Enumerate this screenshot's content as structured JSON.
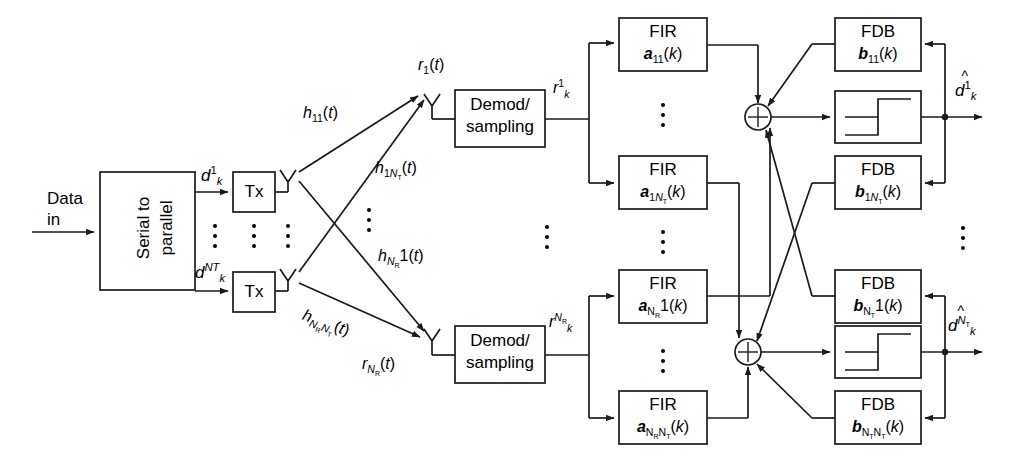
{
  "diagram": {
    "type": "block-diagram",
    "stroke_color": "#1a1a1a",
    "background": "#ffffff"
  },
  "input": {
    "label_line1": "Data",
    "label_line2": "in"
  },
  "serial_to_parallel": {
    "line1": "Serial to",
    "line2": "parallel"
  },
  "tx": {
    "top_label": "Tx",
    "bottom_label": "Tx"
  },
  "tx_signals": {
    "top": {
      "base": "d",
      "sub": "k",
      "sup": "1"
    },
    "bottom": {
      "base": "d",
      "sub": "k",
      "sup": "NT"
    }
  },
  "channels": [
    {
      "name": "h-11",
      "base": "h",
      "sub": "11",
      "arg": "(t)"
    },
    {
      "name": "h-1NT",
      "base": "h",
      "sub": "1N_T",
      "arg": "(t)"
    },
    {
      "name": "h-NR1",
      "base": "h",
      "sub": "N_R 1",
      "arg": "(t)"
    },
    {
      "name": "h-NRNT",
      "base": "h",
      "sub": "N_R N_T",
      "arg": "(t)"
    }
  ],
  "rx_signals": {
    "top": {
      "base": "r",
      "sub": "1",
      "arg": "(t)"
    },
    "bottom": {
      "base": "r",
      "sub": "N_R",
      "arg": "(t)"
    }
  },
  "demod": {
    "top": {
      "line1": "Demod/",
      "line2": "sampling"
    },
    "bottom": {
      "line1": "Demod/",
      "line2": "sampling"
    }
  },
  "demod_out": {
    "top": {
      "base": "r",
      "sub": "k",
      "sup": "1"
    },
    "bottom": {
      "base": "r",
      "sub": "k",
      "sup": "NR"
    }
  },
  "fir_blocks": [
    {
      "name": "fir-a11",
      "title": "FIR",
      "coef": "a",
      "sub": "11",
      "arg": "(k)"
    },
    {
      "name": "fir-a1NT",
      "title": "FIR",
      "coef": "a",
      "sub": "1N_T",
      "arg": "(k)"
    },
    {
      "name": "fir-aNR1",
      "title": "FIR",
      "coef": "a",
      "sub": "N_R 1",
      "arg": "(k)"
    },
    {
      "name": "fir-aNRNT",
      "title": "FIR",
      "coef": "a",
      "sub": "N_R N_T",
      "arg": "(k)"
    }
  ],
  "fdb_blocks": [
    {
      "name": "fdb-b11",
      "title": "FDB",
      "coef": "b",
      "sub": "11",
      "arg": "(k)"
    },
    {
      "name": "fdb-b1NT",
      "title": "FDB",
      "coef": "b",
      "sub": "1N_T",
      "arg": "(k)"
    },
    {
      "name": "fdb-bNT1",
      "title": "FDB",
      "coef": "b",
      "sub": "N_T 1",
      "arg": "(k)"
    },
    {
      "name": "fdb-bNTNT",
      "title": "FDB",
      "coef": "b",
      "sub": "N_T N_T",
      "arg": "(k)"
    }
  ],
  "summers": {
    "symbol": "+",
    "count": 2
  },
  "decision": {
    "type": "signum-threshold",
    "count": 2
  },
  "outputs": {
    "top": {
      "base": "d",
      "hat": "^",
      "sub": "k",
      "sup": "1"
    },
    "bottom": {
      "base": "d",
      "hat": "^",
      "sub": "k",
      "sup": "NT"
    }
  },
  "ellipses": [
    {
      "name": "ellipsis-tx-signals"
    },
    {
      "name": "ellipsis-tx-blocks"
    },
    {
      "name": "ellipsis-tx-antennas"
    },
    {
      "name": "ellipsis-channels"
    },
    {
      "name": "ellipsis-rx-chains"
    },
    {
      "name": "ellipsis-fir-upper"
    },
    {
      "name": "ellipsis-fir-lower"
    },
    {
      "name": "ellipsis-output"
    }
  ]
}
